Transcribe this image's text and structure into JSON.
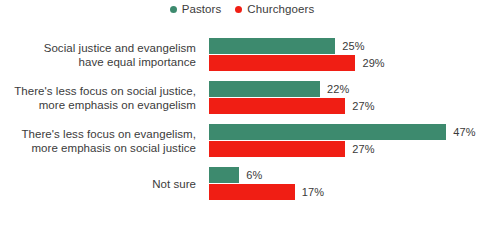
{
  "legend": {
    "items": [
      {
        "label": "Pastors",
        "color": "#3d8a6e",
        "icon": "legend-dot-icon"
      },
      {
        "label": "Churchgoers",
        "color": "#f01e14",
        "icon": "legend-dot-icon"
      }
    ]
  },
  "chart_data": {
    "type": "bar",
    "orientation": "horizontal",
    "title": "",
    "subtitle": "",
    "xlabel": "",
    "ylabel": "",
    "xlim": [
      0,
      50
    ],
    "grid": false,
    "legend_position": "top-center",
    "value_suffix": "%",
    "categories": [
      "Social justice and evangelism have equal importance",
      "There's less focus on social justice, more emphasis on evangelism",
      "There's less focus on evangelism, more emphasis on social justice",
      "Not sure"
    ],
    "category_lines": [
      [
        "Social justice and evangelism",
        "have equal importance"
      ],
      [
        "There's less focus on social justice,",
        "more emphasis on evangelism"
      ],
      [
        "There's less focus on evangelism,",
        "more emphasis on social justice"
      ],
      [
        "Not sure"
      ]
    ],
    "series": [
      {
        "name": "Pastors",
        "color": "#3d8a6e",
        "values": [
          25,
          22,
          47,
          6
        ],
        "labels": [
          "25%",
          "22%",
          "47%",
          "6%"
        ]
      },
      {
        "name": "Churchgoers",
        "color": "#f01e14",
        "values": [
          29,
          27,
          27,
          17
        ],
        "labels": [
          "29%",
          "27%",
          "27%",
          "17%"
        ]
      }
    ]
  },
  "style": {
    "px_per_percent": 5.05,
    "text_color": "#3b3b3b",
    "value_color": "#3a3a3a",
    "background": "#ffffff"
  }
}
